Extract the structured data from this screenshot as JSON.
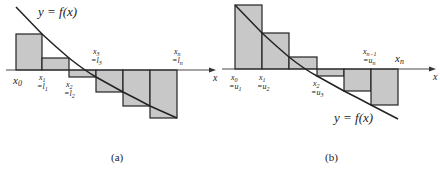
{
  "figure": {
    "panel_a": {
      "caption": "(a)",
      "curve_label": "y = f(x)",
      "axis_label": "x",
      "ticks": [
        {
          "top": "",
          "bottom": "x0",
          "sub": ""
        },
        {
          "bottom": "x1",
          "sub": "=l1"
        },
        {
          "bottom": "x2",
          "sub": "=l2"
        },
        {
          "top": "x3",
          "topsub": "=l3"
        },
        {
          "top": "xn",
          "topsub": "=ln"
        }
      ],
      "x0": "x",
      "x0_sub": "0",
      "x1": "x",
      "x1_sub": "1",
      "l1": "=l",
      "l1_sub": "1",
      "x2": "x",
      "x2_sub": "2",
      "l2": "=l",
      "l2_sub": "2",
      "x3": "x",
      "x3_sub": "3",
      "l3": "=l",
      "l3_sub": "3",
      "xn": "x",
      "xn_sub": "n",
      "ln": "=l",
      "ln_sub": "n"
    },
    "panel_b": {
      "caption": "(b)",
      "curve_label": "y = f(x)",
      "axis_label": "x",
      "x0": "x",
      "x0_sub": "0",
      "u1": "=u",
      "u1_sub": "1",
      "x1": "x",
      "x1_sub": "1",
      "u2": "=u",
      "u2_sub": "2",
      "x2": "x",
      "x2_sub": "2",
      "u3": "=u",
      "u3_sub": "3",
      "xn1": "x",
      "xn1_sub": "n−1",
      "un": "=u",
      "un_sub": "n",
      "xn": "x",
      "xn_sub": "n"
    },
    "colors": {
      "fill": "#c8c8c8",
      "stroke": "#222222"
    }
  }
}
